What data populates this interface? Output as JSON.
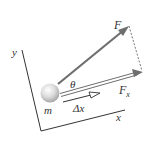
{
  "diagram": {
    "labels": {
      "force": "F",
      "angle": "θ",
      "force_x_base": "F",
      "force_x_sub": "x",
      "mass": "m",
      "displacement": "Δx",
      "y_axis": "y",
      "x_axis": "x"
    },
    "colors": {
      "axis": "#333333",
      "force_arrow": "#6e6e6e",
      "dashed": "#555555",
      "ball_light": "#f4f4f4",
      "ball_dark": "#a8a8a8",
      "text": "#333333"
    }
  }
}
